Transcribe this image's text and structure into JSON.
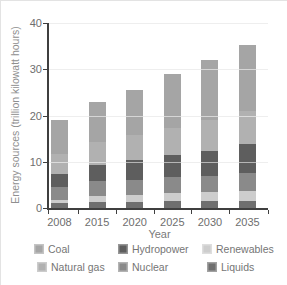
{
  "chart_data": {
    "type": "bar",
    "stacked": true,
    "title": "",
    "xlabel": "Year",
    "ylabel": "Energy sources (trillion kilowatt hours)",
    "categories": [
      "2008",
      "2015",
      "2020",
      "2025",
      "2030",
      "2035"
    ],
    "series": [
      {
        "name": "Liquids",
        "color": "#6f6f6f",
        "values": [
          1.0,
          1.3,
          1.4,
          1.5,
          1.5,
          1.5
        ]
      },
      {
        "name": "Renewables",
        "color": "#cdcdcd",
        "values": [
          0.7,
          1.3,
          1.5,
          1.7,
          1.9,
          2.1
        ]
      },
      {
        "name": "Nuclear",
        "color": "#8a8a8a",
        "values": [
          2.8,
          3.2,
          3.2,
          3.4,
          3.6,
          3.9
        ]
      },
      {
        "name": "Hydropower",
        "color": "#5e5e5e",
        "values": [
          2.8,
          3.5,
          4.3,
          4.8,
          5.3,
          6.3
        ]
      },
      {
        "name": "Natural gas",
        "color": "#b1b1b1",
        "values": [
          4.3,
          5.0,
          5.4,
          6.0,
          6.7,
          7.2
        ]
      },
      {
        "name": "Coal",
        "color": "#a5a5a5",
        "values": [
          7.4,
          8.7,
          9.7,
          11.6,
          13.0,
          14.2
        ]
      }
    ],
    "totals": [
      19.0,
      23.0,
      25.5,
      29.0,
      32.0,
      35.2
    ],
    "ylim": [
      0,
      40
    ],
    "yticks": [
      0,
      10,
      20,
      30,
      40
    ],
    "grid": true,
    "legend_position": "bottom"
  },
  "legend": {
    "items": [
      {
        "label": "Coal",
        "color": "#a5a5a5"
      },
      {
        "label": "Hydropower",
        "color": "#5e5e5e"
      },
      {
        "label": "Renewables",
        "color": "#cdcdcd"
      },
      {
        "label": "Natural gas",
        "color": "#b1b1b1"
      },
      {
        "label": "Nuclear",
        "color": "#8a8a8a"
      },
      {
        "label": "Liquids",
        "color": "#6f6f6f"
      }
    ]
  }
}
